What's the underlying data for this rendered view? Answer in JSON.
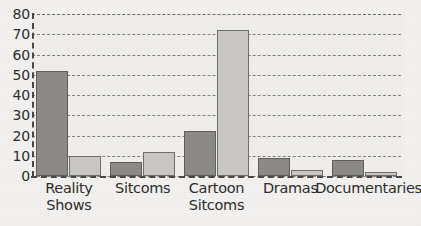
{
  "chart_data": {
    "type": "bar",
    "title": "",
    "subtitle": "",
    "xlabel": "",
    "ylabel": "",
    "ylim": [
      0,
      80
    ],
    "yticks": [
      0,
      10,
      20,
      30,
      40,
      50,
      60,
      70,
      80
    ],
    "grid": true,
    "legend": "none",
    "categories": [
      "Reality\nShows",
      "Sitcoms",
      "Cartoon\nSitcoms",
      "Dramas",
      "Documentaries"
    ],
    "series": [
      {
        "name": "series-1-dark",
        "color": "#8c8b88",
        "values": [
          52,
          7,
          22,
          9,
          8
        ]
      },
      {
        "name": "series-2-light",
        "color": "#c9c8c4",
        "values": [
          10,
          12,
          72,
          3,
          2
        ]
      }
    ]
  },
  "colors": {
    "background": "#f2f1ef",
    "plot_background": "#efeeec",
    "axis": "#4a4845",
    "gridline": "#6e6c68",
    "text": "#2e2c2a",
    "series_dark": "#8c8b88",
    "series_light": "#c9c8c4"
  }
}
